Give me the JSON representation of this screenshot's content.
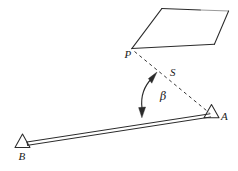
{
  "figure": {
    "stroke_color": "#2b2b2b",
    "faint_stroke_color": "#9a9a9a",
    "background": "#ffffff",
    "labels": {
      "point_p": "P",
      "distance_s": "S",
      "angle_beta": "β",
      "station_a": "A",
      "station_b": "B"
    },
    "elements": {
      "building_name": "tilted-rectangle-building",
      "baseline_name": "baseline-b-to-a",
      "sightline_name": "dashed-sightline-p-to-a",
      "arc_name": "angle-arc-beta"
    },
    "geometry": {
      "building_corners": [
        [
          131.5,
          48.5
        ],
        [
          162.0,
          8.5
        ],
        [
          229.0,
          11.0
        ],
        [
          214.5,
          44.0
        ]
      ],
      "point_p": [
        133.0,
        49.0
      ],
      "station_a": [
        211.5,
        115.0
      ],
      "station_b": [
        22.5,
        146.0
      ],
      "arc_vertex": [
        145.0,
        117.5
      ],
      "arc_start": [
        144.5,
        110.0
      ],
      "arc_end": [
        153.0,
        74.0
      ]
    }
  }
}
